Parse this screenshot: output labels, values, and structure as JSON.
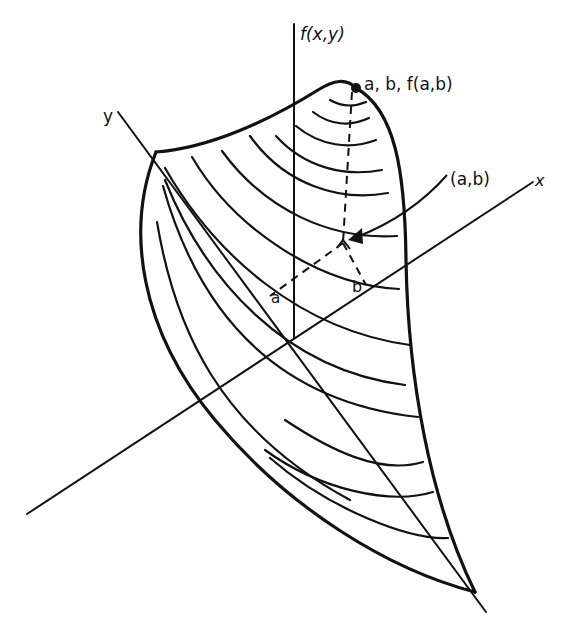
{
  "figure": {
    "type": "3d-surface-diagram"
  },
  "axes": {
    "f_axis_label": "f(x,y)",
    "x_axis_label": "x",
    "y_axis_label": "y"
  },
  "annotations": {
    "peak_point_label": "a, b, f(a,b)",
    "projection_label": "(a,b)",
    "a_label": "a",
    "b_label": "b"
  },
  "colors": {
    "ink": "#111111",
    "background": "#ffffff"
  }
}
